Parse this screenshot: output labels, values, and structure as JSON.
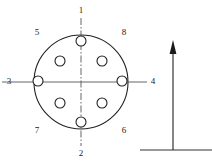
{
  "figure": {
    "type": "bolt-circle-hole-pattern",
    "background_color": "#ffffff",
    "line_color": "#222222",
    "centerline_color": "#555555"
  },
  "flange": {
    "center_x": 81,
    "center_y": 82,
    "radius": 47,
    "bolt_circle_radius": 30,
    "hole_radius": 5
  },
  "holes": [
    {
      "label": "1",
      "position": "top",
      "hole_x": 81,
      "hole_y": 52,
      "label_x": 81,
      "label_y": 11
    },
    {
      "label": "2",
      "position": "bottom",
      "hole_x": 81,
      "hole_y": 112,
      "label_x": 81,
      "label_y": 154
    },
    {
      "label": "3",
      "position": "left",
      "hole_x": 51,
      "hole_y": 82,
      "label_x": 9,
      "label_y": 82
    },
    {
      "label": "4",
      "position": "right",
      "hole_x": 111,
      "hole_y": 82,
      "label_x": 153,
      "label_y": 82
    },
    {
      "label": "5",
      "position": "upper-left",
      "hole_x": 60,
      "hole_y": 61,
      "label_x": 37,
      "label_y": 33
    },
    {
      "label": "6",
      "position": "lower-right",
      "hole_x": 102,
      "hole_y": 103,
      "label_x": 124,
      "label_y": 131
    },
    {
      "label": "7",
      "position": "lower-left",
      "hole_x": 60,
      "hole_y": 103,
      "label_x": 37,
      "label_y": 131
    },
    {
      "label": "8",
      "position": "upper-right",
      "hole_x": 102,
      "hole_y": 61,
      "label_x": 124,
      "label_y": 33
    }
  ],
  "edge_holes": [
    {
      "name": "top-edge-hole",
      "x": 81,
      "y": 41
    },
    {
      "name": "bottom-edge-hole",
      "x": 81,
      "y": 122
    },
    {
      "name": "left-edge-hole",
      "x": 38,
      "y": 81
    },
    {
      "name": "right-edge-hole",
      "x": 122,
      "y": 81
    }
  ],
  "centerlines": {
    "vertical": {
      "x": 81,
      "y1": 18,
      "y2": 146
    },
    "horizontal": {
      "y": 82,
      "x1": 2,
      "x2": 147
    }
  },
  "arrow": {
    "name": "direction-arrow",
    "x": 173,
    "tip_y": 40,
    "tail_y": 150,
    "head_width": 7,
    "head_height": 14,
    "baseline": {
      "y": 150,
      "x1": 140,
      "x2": 212
    }
  }
}
